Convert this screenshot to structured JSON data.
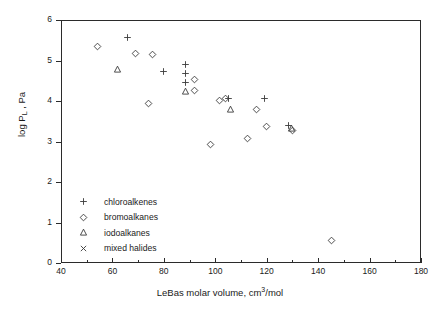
{
  "chart_data": {
    "type": "scatter",
    "title": "",
    "xlabel": "LeBas molar volume, cm3/mol",
    "xlabel_parts": {
      "pre": "LeBas molar volume, cm",
      "sup": "3",
      "post": "/mol"
    },
    "ylabel": "log PL , Pa",
    "ylabel_parts": {
      "pre": "log P",
      "sub": "L",
      "post": " , Pa"
    },
    "xlim": [
      40,
      180
    ],
    "ylim": [
      0,
      6
    ],
    "xticks": [
      40,
      60,
      80,
      100,
      120,
      140,
      160,
      180
    ],
    "xticks_minor": [
      50,
      70,
      90,
      110,
      130,
      150,
      170
    ],
    "yticks": [
      0,
      1,
      2,
      3,
      4,
      5,
      6
    ],
    "grid": false,
    "legend_position": "inside-lower-left",
    "series": [
      {
        "name": "chloroalkenes",
        "marker": "plus",
        "points": [
          [
            66.0,
            5.57
          ],
          [
            80.0,
            4.73
          ],
          [
            88.5,
            4.91
          ],
          [
            88.5,
            4.68
          ],
          [
            88.5,
            4.45
          ],
          [
            105.0,
            4.05
          ],
          [
            119.0,
            4.05
          ],
          [
            128.5,
            3.4
          ]
        ]
      },
      {
        "name": "bromoalkanes",
        "marker": "diamond",
        "points": [
          [
            54.0,
            5.35
          ],
          [
            69.0,
            5.18
          ],
          [
            75.5,
            5.16
          ],
          [
            74.0,
            3.95
          ],
          [
            92.0,
            4.53
          ],
          [
            92.0,
            4.27
          ],
          [
            101.5,
            4.02
          ],
          [
            98.0,
            2.92
          ],
          [
            104.0,
            4.05
          ],
          [
            112.5,
            3.07
          ],
          [
            116.0,
            3.78
          ],
          [
            120.0,
            3.38
          ],
          [
            130.0,
            3.28
          ],
          [
            145.0,
            0.55
          ]
        ]
      },
      {
        "name": "iodoalkanes",
        "marker": "triangle",
        "points": [
          [
            62.0,
            4.77
          ],
          [
            88.5,
            4.23
          ],
          [
            106.0,
            3.78
          ],
          [
            129.5,
            3.32
          ]
        ]
      },
      {
        "name": "mixed halides",
        "marker": "cross",
        "points": []
      }
    ]
  },
  "legend": {
    "items": [
      {
        "marker": "plus",
        "label": "chloroalkenes"
      },
      {
        "marker": "diamond",
        "label": "bromoalkanes"
      },
      {
        "marker": "triangle",
        "label": "iodoalkanes"
      },
      {
        "marker": "cross",
        "label": "mixed halides"
      }
    ]
  },
  "colors": {
    "axis": "#2b2b2b",
    "marker": "#3a3a3a",
    "text": "#1a1a1a",
    "background": "#ffffff"
  }
}
